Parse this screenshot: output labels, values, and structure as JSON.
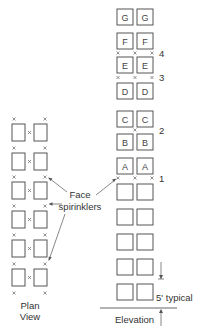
{
  "diagram": {
    "plan_view": {
      "label_line1": "Plan",
      "label_line2": "View",
      "rows": 6
    },
    "elevation": {
      "label": "Elevation",
      "dimension_label": "5' typical",
      "box_rows": [
        {
          "left": "G",
          "right": "G"
        },
        {
          "left": "F",
          "right": "F"
        },
        {
          "left": "E",
          "right": "E"
        },
        {
          "left": "D",
          "right": "D"
        },
        {
          "left": "C",
          "right": "C"
        },
        {
          "left": "B",
          "right": "B"
        },
        {
          "left": "A",
          "right": "A"
        },
        {
          "left": "",
          "right": ""
        },
        {
          "left": "",
          "right": ""
        },
        {
          "left": "",
          "right": ""
        },
        {
          "left": "",
          "right": ""
        },
        {
          "left": "",
          "right": ""
        }
      ],
      "sprinkler_levels": [
        "4",
        "3",
        "2",
        "1"
      ]
    },
    "callout": {
      "line1": "Face",
      "line2": "spirinklers"
    },
    "colors": {
      "stroke": "#555555",
      "text": "#333333",
      "background": "#ffffff"
    }
  }
}
